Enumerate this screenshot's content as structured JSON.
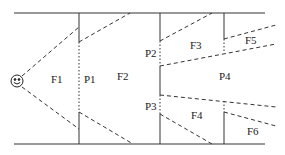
{
  "diagram": {
    "observer_icon": "smiley-face-icon",
    "regions": {
      "F1": "F1",
      "F2": "F2",
      "F3": "F3",
      "F4": "F4",
      "F5": "F5",
      "F6": "F6"
    },
    "portals": {
      "P1": "P1",
      "P2": "P2",
      "P3": "P3",
      "P4": "P4"
    },
    "colors": {
      "line": "#333333",
      "background": "#ffffff"
    }
  }
}
